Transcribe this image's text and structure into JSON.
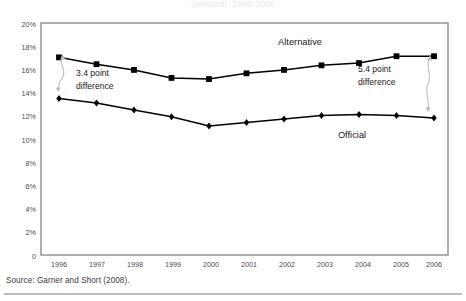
{
  "figure": {
    "clipped_title": "(percent), 1996-2006",
    "source_note": "Source: Garner and Short (2008).",
    "frame_color": "#8a8d91",
    "series_color": "#000000"
  },
  "chart_data": {
    "type": "line",
    "title": "",
    "xlabel": "",
    "ylabel": "",
    "ylim": [
      0,
      20
    ],
    "grid": false,
    "legend_position": "inline-labels",
    "categories": [
      "1996",
      "1997",
      "1998",
      "1999",
      "2000",
      "2001",
      "2002",
      "2003",
      "2004",
      "2005",
      "2006"
    ],
    "ytick_labels": [
      "20%",
      "18%",
      "16%",
      "14%",
      "12%",
      "10%",
      "8%",
      "6%",
      "4%",
      "2%",
      "0"
    ],
    "ytick_values": [
      20,
      18,
      16,
      14,
      12,
      10,
      8,
      6,
      4,
      2,
      0
    ],
    "series": [
      {
        "name": "Alternative",
        "marker": "square",
        "values": [
          17.3,
          16.7,
          16.2,
          15.5,
          15.4,
          15.9,
          16.2,
          16.6,
          16.8,
          17.4,
          17.4
        ],
        "label_x": 2003,
        "label_y": 18.9
      },
      {
        "name": "Official",
        "marker": "diamond",
        "values": [
          13.7,
          13.3,
          12.7,
          12.1,
          11.3,
          11.6,
          11.9,
          12.2,
          12.3,
          12.2,
          12.0
        ],
        "label_x": 2004,
        "label_y": 10.0
      }
    ],
    "annotations": [
      {
        "id": "left-difference",
        "text_line1": "3.4 point",
        "text_line2": "difference",
        "value": 3.4,
        "at_category": "1996"
      },
      {
        "id": "right-difference",
        "text_line1": "5.4 point",
        "text_line2": "difference",
        "value": 5.4,
        "at_category": "2006"
      }
    ]
  }
}
